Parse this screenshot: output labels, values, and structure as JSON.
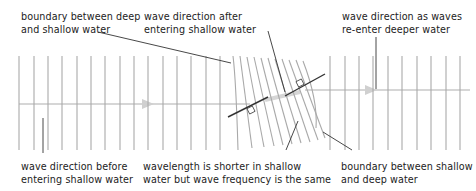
{
  "labels": {
    "top_left": {
      "line1": "boundary between deep",
      "line2": "and shallow water"
    },
    "top_middle": {
      "line1": "wave direction after",
      "line2": "entering shallow water"
    },
    "top_right": {
      "line1": "wave direction as waves",
      "line2": "re-enter deeper water"
    },
    "bottom_left": {
      "line1": "wave direction before",
      "line2": "entering shallow water"
    },
    "bottom_middle": {
      "line1": "wavelength is shorter in shallow",
      "line2": "water but wave frequency is the same"
    },
    "bottom_right": {
      "line1": "boundary between shallow",
      "line2": "and deep water"
    }
  },
  "colors": {
    "wavefront": "#a8a8a8",
    "direction_arrow": "#d4d4d4",
    "leader_line": "#333333",
    "text": "#222222"
  },
  "deep_left_wavefronts_x": [
    19,
    34,
    48,
    62,
    77,
    91,
    105,
    120,
    134,
    148,
    163,
    177,
    191,
    206,
    220
  ],
  "deep_right_wavefronts_x": [
    330,
    345,
    359,
    373,
    388,
    402,
    417,
    431,
    446,
    460
  ]
}
